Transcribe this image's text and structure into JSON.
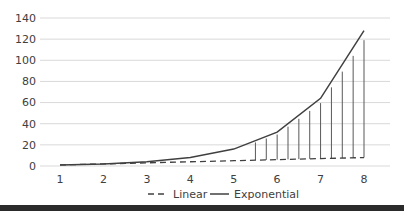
{
  "chart_data": {
    "type": "line",
    "title": "",
    "xlabel": "",
    "ylabel": "",
    "x": [
      1,
      2,
      3,
      4,
      5,
      6,
      7,
      8
    ],
    "series": [
      {
        "name": "Linear",
        "style": "dashed",
        "values": [
          1,
          2,
          3,
          4,
          5,
          6,
          7,
          8
        ]
      },
      {
        "name": "Exponential",
        "style": "solid",
        "values": [
          1,
          2,
          4,
          8,
          16,
          32,
          64,
          128
        ]
      }
    ],
    "drop_lines": {
      "description": "vertical lines from Linear to Exponential curve between x=5.5 and x=8",
      "x": [
        5.5,
        5.75,
        6,
        6.25,
        6.5,
        6.75,
        7,
        7.25,
        7.5,
        7.75,
        8
      ]
    },
    "yticks": [
      0,
      20,
      40,
      60,
      80,
      100,
      120,
      140
    ],
    "xticks": [
      1,
      2,
      3,
      4,
      5,
      6,
      7,
      8
    ],
    "ylim": [
      0,
      140
    ],
    "xlim": [
      1,
      8
    ],
    "grid": {
      "horizontal": true,
      "vertical": false
    },
    "legend": {
      "position": "bottom",
      "entries": [
        "Linear",
        "Exponential"
      ]
    },
    "colors": {
      "line": "#404040",
      "grid": "#d9d9d9",
      "drop": "#595959"
    }
  },
  "legend": {
    "linear_label": "Linear",
    "exponential_label": "Exponential"
  },
  "axis": {
    "y_labels": [
      "0",
      "20",
      "40",
      "60",
      "80",
      "100",
      "120",
      "140"
    ],
    "x_labels": [
      "1",
      "2",
      "3",
      "4",
      "5",
      "6",
      "7",
      "8"
    ]
  }
}
